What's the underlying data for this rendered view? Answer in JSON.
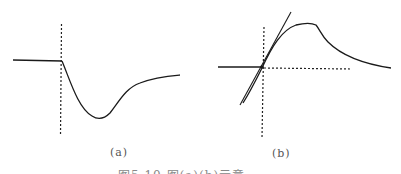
{
  "figure": {
    "panels": [
      {
        "id": "a",
        "label": "(a)",
        "description": "Response curve: flat baseline, sharp drop after the dashed marker, minimum, then gradual recovery toward a plateau"
      },
      {
        "id": "b",
        "label": "(b)",
        "description": "Response curve rising through the intersection of dashed axes with a tangent line, reaching a peak plateau, then decaying"
      }
    ],
    "caption": "图5.10  图(a)(b)示意……",
    "colors": {
      "line": "#1a1a1a",
      "label": "#555555",
      "caption": "#888888"
    }
  }
}
